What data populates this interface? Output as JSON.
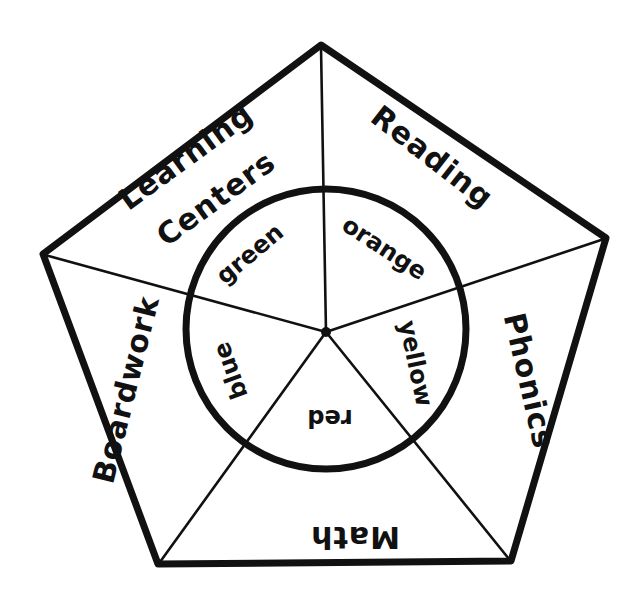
{
  "diagram": {
    "type": "pentagon-wheel",
    "colors": {
      "ink": "#111111",
      "background": "#ffffff"
    },
    "outer_sectors": [
      {
        "id": "learning-centers",
        "label_line1": "Learning",
        "label_line2": "Centers"
      },
      {
        "id": "reading",
        "label": "Reading"
      },
      {
        "id": "phonics",
        "label": "Phonics"
      },
      {
        "id": "math",
        "label": "Math"
      },
      {
        "id": "boardwork",
        "label": "Boardwork"
      }
    ],
    "inner_sectors": [
      {
        "id": "green",
        "label": "green",
        "outer_pair": "Learning Centers"
      },
      {
        "id": "orange",
        "label": "orange",
        "outer_pair": "Reading"
      },
      {
        "id": "yellow",
        "label": "yellow",
        "outer_pair": "Phonics"
      },
      {
        "id": "red",
        "label": "red",
        "outer_pair": "Math"
      },
      {
        "id": "blue",
        "label": "blue",
        "outer_pair": "Boardwork"
      }
    ]
  }
}
